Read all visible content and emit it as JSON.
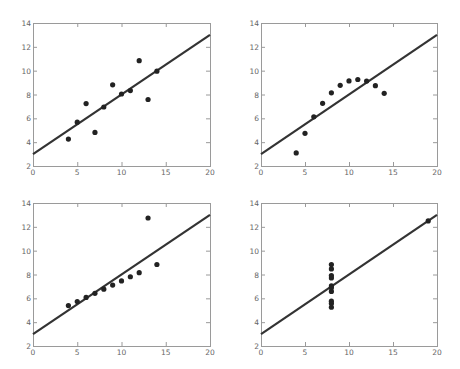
{
  "chart_data": [
    {
      "type": "scatter",
      "title": "",
      "xlabel": "",
      "ylabel": "",
      "xlim": [
        0,
        20
      ],
      "ylim": [
        2,
        14
      ],
      "xticks": [
        0,
        5,
        10,
        15,
        20
      ],
      "yticks": [
        2,
        4,
        6,
        8,
        10,
        12,
        14
      ],
      "x": [
        10,
        8,
        13,
        9,
        11,
        14,
        6,
        4,
        12,
        7,
        5
      ],
      "y": [
        8.04,
        6.95,
        7.58,
        8.81,
        8.33,
        9.96,
        7.24,
        4.26,
        10.84,
        4.82,
        5.68
      ],
      "fit_line": {
        "intercept": 3,
        "slope": 0.5
      }
    },
    {
      "type": "scatter",
      "title": "",
      "xlabel": "",
      "ylabel": "",
      "xlim": [
        0,
        20
      ],
      "ylim": [
        2,
        14
      ],
      "xticks": [
        0,
        5,
        10,
        15,
        20
      ],
      "yticks": [
        2,
        4,
        6,
        8,
        10,
        12,
        14
      ],
      "x": [
        10,
        8,
        13,
        9,
        11,
        14,
        6,
        4,
        12,
        7,
        5
      ],
      "y": [
        9.14,
        8.14,
        8.74,
        8.77,
        9.26,
        8.1,
        6.13,
        3.1,
        9.13,
        7.26,
        4.74
      ],
      "fit_line": {
        "intercept": 3,
        "slope": 0.5
      }
    },
    {
      "type": "scatter",
      "title": "",
      "xlabel": "",
      "ylabel": "",
      "xlim": [
        0,
        20
      ],
      "ylim": [
        2,
        14
      ],
      "xticks": [
        0,
        5,
        10,
        15,
        20
      ],
      "yticks": [
        2,
        4,
        6,
        8,
        10,
        12,
        14
      ],
      "x": [
        10,
        8,
        13,
        9,
        11,
        14,
        6,
        4,
        12,
        7,
        5
      ],
      "y": [
        7.46,
        6.77,
        12.74,
        7.11,
        7.81,
        8.84,
        6.08,
        5.39,
        8.15,
        6.42,
        5.73
      ],
      "fit_line": {
        "intercept": 3,
        "slope": 0.5
      }
    },
    {
      "type": "scatter",
      "title": "",
      "xlabel": "",
      "ylabel": "",
      "xlim": [
        0,
        20
      ],
      "ylim": [
        2,
        14
      ],
      "xticks": [
        0,
        5,
        10,
        15,
        20
      ],
      "yticks": [
        2,
        4,
        6,
        8,
        10,
        12,
        14
      ],
      "x": [
        8,
        8,
        8,
        8,
        8,
        8,
        8,
        19,
        8,
        8,
        8
      ],
      "y": [
        6.58,
        5.76,
        7.71,
        8.84,
        8.47,
        7.04,
        5.25,
        12.5,
        5.56,
        7.91,
        6.89
      ],
      "fit_line": {
        "intercept": 3,
        "slope": 0.5
      }
    }
  ]
}
